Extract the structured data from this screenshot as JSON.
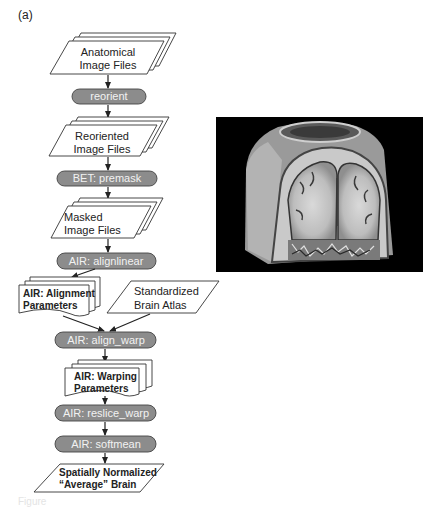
{
  "panel_label": "(a)",
  "caption": "Figure",
  "nodes": {
    "anatomical": {
      "type": "multi-file",
      "line1": "Anatomical",
      "line2": "Image Files"
    },
    "reorient": {
      "type": "process",
      "label": "reorient"
    },
    "reoriented": {
      "type": "multi-file",
      "line1": "Reoriented",
      "line2": "Image Files"
    },
    "premask": {
      "type": "process",
      "label": "BET: premask"
    },
    "masked": {
      "type": "multi-file",
      "line1": "Masked",
      "line2": "Image Files"
    },
    "alignlinear": {
      "type": "process",
      "label": "AIR: alignlinear"
    },
    "alignment_params": {
      "type": "multi-document",
      "line1": "AIR: Alignment",
      "line2": "Parameters"
    },
    "atlas": {
      "type": "file",
      "line1": "Standardized",
      "line2": "Brain Atlas"
    },
    "align_warp": {
      "type": "process",
      "label": "AIR: align_warp"
    },
    "warping_params": {
      "type": "multi-document",
      "line1": "AIR: Warping",
      "line2": "Parameters"
    },
    "reslice_warp": {
      "type": "process",
      "label": "AIR: reslice_warp"
    },
    "softmean": {
      "type": "process",
      "label": "AIR: softmean"
    },
    "output": {
      "type": "file",
      "line1": "Spatially Normalized",
      "line2": "“Average” Brain"
    }
  },
  "edges": [
    [
      "anatomical",
      "reorient"
    ],
    [
      "reorient",
      "reoriented"
    ],
    [
      "reoriented",
      "premask"
    ],
    [
      "premask",
      "masked"
    ],
    [
      "masked",
      "alignlinear"
    ],
    [
      "alignlinear",
      "alignment_params"
    ],
    [
      "alignment_params",
      "align_warp"
    ],
    [
      "atlas",
      "align_warp"
    ],
    [
      "align_warp",
      "warping_params"
    ],
    [
      "warping_params",
      "reslice_warp"
    ],
    [
      "reslice_warp",
      "softmean"
    ],
    [
      "softmean",
      "output"
    ]
  ],
  "image": {
    "description": "3D rendered MRI brain volume with coronal cutaway",
    "background": "#000000"
  },
  "colors": {
    "process_fill": "#8c8c8c",
    "process_text": "#f2f2f2",
    "stroke": "#333333"
  }
}
